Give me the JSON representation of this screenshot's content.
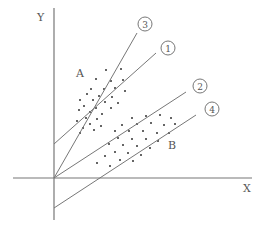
{
  "diagram": {
    "type": "scatter-with-lines",
    "axes": {
      "x_label": "X",
      "y_label": "Y",
      "origin": [
        54,
        178
      ],
      "x_axis": {
        "x1": 13,
        "x2": 252,
        "y": 178
      },
      "y_axis": {
        "x": 54,
        "y1": 8,
        "y2": 220
      }
    },
    "clusters": [
      {
        "name": "A",
        "label_pos": [
          80,
          77
        ]
      },
      {
        "name": "B",
        "label_pos": [
          172,
          149
        ]
      }
    ],
    "lines": [
      {
        "id": "1",
        "label": "1",
        "from": [
          54,
          144
        ],
        "to": [
          156,
          53
        ],
        "circle": [
          168,
          48
        ]
      },
      {
        "id": "2",
        "label": "2",
        "from": [
          54,
          178
        ],
        "to": [
          186,
          92
        ],
        "circle": [
          200,
          86
        ]
      },
      {
        "id": "3",
        "label": "3",
        "from": [
          54,
          178
        ],
        "to": [
          137,
          33
        ],
        "circle": [
          145,
          24
        ]
      },
      {
        "id": "4",
        "label": "4",
        "from": [
          54,
          208
        ],
        "to": [
          196,
          115
        ],
        "circle": [
          212,
          109
        ]
      }
    ],
    "colors": {
      "line": "#777777",
      "dot": "#333333",
      "text": "#555555"
    }
  },
  "chart_data": {
    "type": "scatter",
    "title": "",
    "xlabel": "X",
    "ylabel": "Y",
    "series": [
      {
        "name": "A",
        "points": [
          [
            106,
            70
          ],
          [
            121,
            69
          ],
          [
            96,
            79
          ],
          [
            111,
            81
          ],
          [
            123,
            80
          ],
          [
            91,
            89
          ],
          [
            104,
            89
          ],
          [
            115,
            88
          ],
          [
            125,
            91
          ],
          [
            87,
            94
          ],
          [
            99,
            96
          ],
          [
            112,
            97
          ],
          [
            80,
            100
          ],
          [
            93,
            100
          ],
          [
            105,
            102
          ],
          [
            118,
            103
          ],
          [
            84,
            106
          ],
          [
            96,
            108
          ],
          [
            111,
            108
          ],
          [
            79,
            110
          ],
          [
            90,
            112
          ],
          [
            102,
            114
          ],
          [
            86,
            118
          ],
          [
            97,
            119
          ],
          [
            77,
            121
          ],
          [
            90,
            124
          ],
          [
            101,
            126
          ],
          [
            83,
            128
          ],
          [
            94,
            130
          ],
          [
            80,
            133
          ]
        ]
      },
      {
        "name": "B",
        "points": [
          [
            132,
            118
          ],
          [
            146,
            116
          ],
          [
            160,
            115
          ],
          [
            171,
            118
          ],
          [
            122,
            125
          ],
          [
            137,
            124
          ],
          [
            151,
            123
          ],
          [
            164,
            125
          ],
          [
            175,
            124
          ],
          [
            115,
            131
          ],
          [
            129,
            131
          ],
          [
            143,
            131
          ],
          [
            157,
            133
          ],
          [
            169,
            133
          ],
          [
            118,
            138
          ],
          [
            132,
            139
          ],
          [
            146,
            139
          ],
          [
            158,
            141
          ],
          [
            109,
            144
          ],
          [
            123,
            145
          ],
          [
            137,
            146
          ],
          [
            150,
            148
          ],
          [
            115,
            152
          ],
          [
            128,
            153
          ],
          [
            141,
            155
          ],
          [
            105,
            156
          ],
          [
            120,
            160
          ],
          [
            133,
            161
          ],
          [
            97,
            163
          ],
          [
            110,
            166
          ]
        ]
      }
    ],
    "lines": [
      "1",
      "2",
      "3",
      "4"
    ],
    "grid": false
  }
}
